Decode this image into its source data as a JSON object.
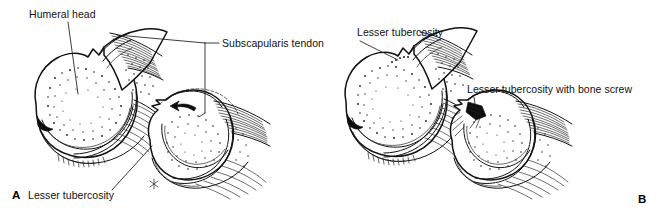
{
  "figure": {
    "caption_type": "anatomical-line-illustration",
    "background_color": "#ffffff",
    "ink_color": "#111111",
    "width": 661,
    "height": 216
  },
  "panels": [
    {
      "id": "A",
      "letter": "A",
      "letter_x": 12,
      "letter_y": 199,
      "views": 2
    },
    {
      "id": "B",
      "letter": "B",
      "letter_x": 638,
      "letter_y": 203,
      "views": 2
    }
  ],
  "labels": [
    {
      "id": "humeral-head",
      "text": "Humeral head",
      "x": 29,
      "y": 18,
      "anchor": "start",
      "panel": "A"
    },
    {
      "id": "subscapularis-tendon",
      "text": "Subscapularis tendon",
      "x": 222,
      "y": 47,
      "anchor": "start",
      "panel": "A"
    },
    {
      "id": "lesser-tubercosity-a",
      "text": "Lesser tubercosity",
      "x": 28,
      "y": 199,
      "anchor": "start",
      "panel": "A"
    },
    {
      "id": "lesser-tubercosity-b",
      "text": "Lesser tubercosity",
      "x": 357,
      "y": 36,
      "anchor": "start",
      "panel": "B"
    },
    {
      "id": "lesser-tubercosity-bone-screw",
      "text": "Lesser tubercosity with bone screw",
      "x": 467,
      "y": 93,
      "anchor": "start",
      "panel": "B"
    }
  ],
  "markers": [
    {
      "id": "asterisk-marker",
      "glyph": "✳",
      "x": 153,
      "y": 184,
      "panel": "A",
      "note": "star marker on inferior capsule"
    }
  ]
}
